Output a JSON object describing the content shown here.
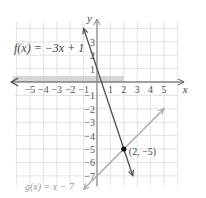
{
  "chart_data": {
    "type": "line",
    "title": "",
    "xlabel": "x",
    "ylabel": "y",
    "xlim": [
      -6,
      6
    ],
    "ylim": [
      -8,
      4
    ],
    "grid": true,
    "x_ticks": [
      "-5",
      "-4",
      "-3",
      "-2",
      "-1",
      "1",
      "2",
      "3",
      "4",
      "5"
    ],
    "y_ticks": [
      "3",
      "2",
      "1",
      "-1",
      "-2",
      "-3",
      "-4",
      "-5",
      "-6",
      "-7"
    ],
    "series": [
      {
        "name": "f(x) = -3x + 1",
        "slope": -3,
        "intercept": 1,
        "color": "#555555",
        "points": [
          [
            -1,
            4
          ],
          [
            2.67,
            -7
          ]
        ]
      },
      {
        "name": "g(x) = x - 7",
        "slope": 1,
        "intercept": -7,
        "color": "#aaaaaa",
        "points": [
          [
            -1,
            -8
          ],
          [
            5,
            -2
          ]
        ]
      }
    ],
    "shaded_region": {
      "description": "horizontal band along x-axis for x < 2",
      "color": "#cccccc"
    },
    "annotations": [
      {
        "text": "f(x) = −3x + 1",
        "position": "upper-left"
      },
      {
        "text": "g(x) = x − 7",
        "position": "lower-left"
      },
      {
        "text": "(2, −5)",
        "point": [
          2,
          -5
        ]
      }
    ]
  },
  "labels": {
    "f": "f(x) = −3x + 1",
    "g": "g(x) = x − 7",
    "point": "(2, −5)",
    "x_axis": "x",
    "y_axis": "y"
  }
}
